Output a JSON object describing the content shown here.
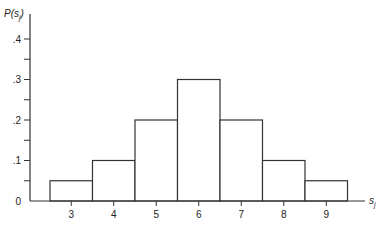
{
  "chart_data": {
    "type": "bar",
    "title": "",
    "xlabel": "s_j",
    "ylabel": "P(s_j)",
    "categories": [
      "3",
      "4",
      "5",
      "6",
      "7",
      "8",
      "9"
    ],
    "values": [
      0.05,
      0.1,
      0.2,
      0.3,
      0.2,
      0.1,
      0.05
    ],
    "ylim": [
      0,
      0.4
    ],
    "yticks": [
      "0",
      ".1",
      ".2",
      ".3",
      ".4"
    ],
    "grid": false,
    "legend": null
  },
  "axis": {
    "ylabel_main": "P",
    "ylabel_open": "(",
    "ylabel_var": "s",
    "ylabel_sub": "j",
    "ylabel_close": ")",
    "xlabel_var": "s",
    "xlabel_sub": "j"
  }
}
